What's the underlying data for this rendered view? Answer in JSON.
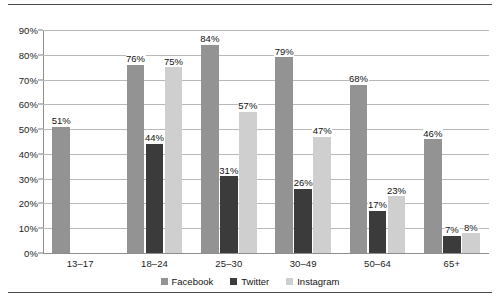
{
  "chart_data": {
    "type": "bar",
    "title": "",
    "subtitle": "",
    "xlabel": "",
    "ylabel": "",
    "categories": [
      "13–17",
      "18–24",
      "25–30",
      "30–49",
      "50–64",
      "65+"
    ],
    "series": [
      {
        "name": "Facebook",
        "color": "#939393",
        "values": [
          51,
          76,
          84,
          79,
          68,
          46
        ]
      },
      {
        "name": "Twitter",
        "color": "#3b3b3b",
        "values": [
          null,
          44,
          31,
          26,
          17,
          7
        ]
      },
      {
        "name": "Instagram",
        "color": "#cfcfcf",
        "values": [
          null,
          75,
          57,
          47,
          23,
          8
        ]
      }
    ],
    "value_labels": [
      [
        "51%",
        null,
        null
      ],
      [
        "76%",
        "44%",
        "75%"
      ],
      [
        "84%",
        "31%",
        "57%"
      ],
      [
        "79%",
        "26%",
        "47%"
      ],
      [
        "68%",
        "17%",
        "23%"
      ],
      [
        "46%",
        "7%",
        "8%"
      ]
    ],
    "ylim": [
      0,
      90
    ],
    "ytick_values": [
      0,
      10,
      20,
      30,
      40,
      50,
      60,
      70,
      80,
      90
    ],
    "ytick_labels": [
      "0%",
      "10%",
      "20%",
      "30%",
      "40%",
      "50%",
      "60%",
      "70%",
      "80%",
      "90%"
    ],
    "grid": true,
    "grid_axis": "y",
    "legend_position": "bottom",
    "legend": [
      "Facebook",
      "Twitter",
      "Instagram"
    ],
    "value_labels_shown": true
  }
}
